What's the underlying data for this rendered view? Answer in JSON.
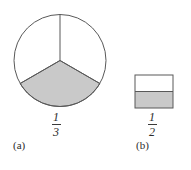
{
  "figure": {
    "background_color": "#ffffff",
    "stroke_color": "#595959",
    "shade_color": "#c9c9c9",
    "panels": [
      {
        "id": "a",
        "caption": "(a)",
        "shape": "circle",
        "total_parts": 3,
        "shaded_parts": 1,
        "fraction": {
          "numerator": "1",
          "denominator": "3"
        },
        "geometry": {
          "center_x": 48,
          "center_y": 48.5,
          "radius": 46,
          "divider_angles_deg": [
            90,
            210,
            330
          ],
          "shaded_sector_start_deg": 210,
          "shaded_sector_end_deg": 330
        }
      },
      {
        "id": "b",
        "caption": "(b)",
        "shape": "square",
        "total_parts": 2,
        "shaded_parts": 1,
        "fraction": {
          "numerator": "1",
          "denominator": "2"
        },
        "geometry": {
          "x": 1,
          "y": 1,
          "width": 38,
          "height": 33,
          "divider_y": 17.5,
          "shaded_part": "bottom"
        }
      }
    ]
  }
}
